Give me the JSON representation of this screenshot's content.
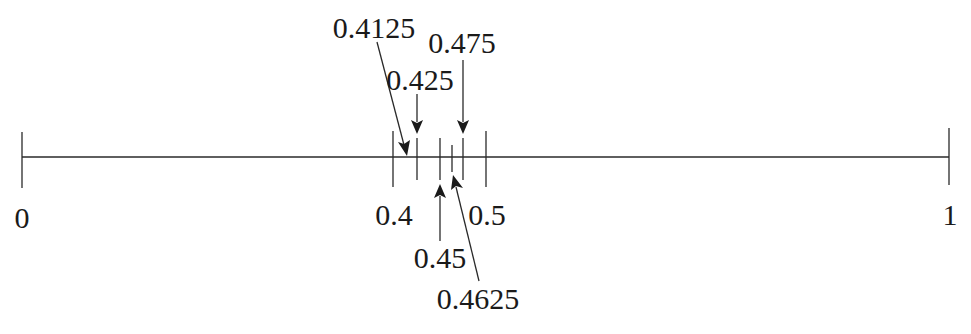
{
  "number_line": {
    "min": 0,
    "max": 1,
    "axis": {
      "x_start": 22,
      "x_end": 949,
      "y": 157
    },
    "endpoint_labels": [
      {
        "id": "zero",
        "text": "0",
        "value": 0
      },
      {
        "id": "one",
        "text": "1",
        "value": 1
      }
    ],
    "interval_labels": [
      {
        "id": "p4",
        "text": "0.4",
        "value": 0.4
      },
      {
        "id": "p5",
        "text": "0.5",
        "value": 0.5
      }
    ],
    "ticks": [
      {
        "value": 0,
        "size": "large"
      },
      {
        "value": 0.4,
        "size": "large"
      },
      {
        "value": 0.425,
        "size": "medium"
      },
      {
        "value": 0.45,
        "size": "medium"
      },
      {
        "value": 0.4625,
        "size": "small"
      },
      {
        "value": 0.475,
        "size": "medium"
      },
      {
        "value": 0.5,
        "size": "large"
      },
      {
        "value": 1,
        "size": "large"
      }
    ],
    "arrow_labels": [
      {
        "id": "a4125",
        "text": "0.4125",
        "value": 0.4125,
        "position": "above"
      },
      {
        "id": "a425",
        "text": "0.425",
        "value": 0.425,
        "position": "above"
      },
      {
        "id": "a475",
        "text": "0.475",
        "value": 0.475,
        "position": "above"
      },
      {
        "id": "a45",
        "text": "0.45",
        "value": 0.45,
        "position": "below"
      },
      {
        "id": "a4625",
        "text": "0.4625",
        "value": 0.4625,
        "position": "below"
      }
    ]
  },
  "colors": {
    "line": "#2a2a2a",
    "text": "#1a1a1a",
    "background": "#ffffff"
  }
}
